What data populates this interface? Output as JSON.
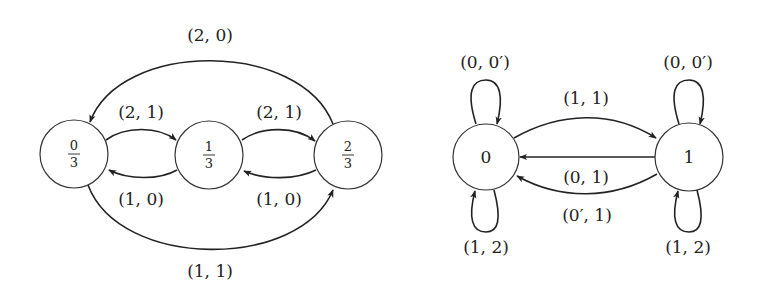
{
  "diagrams": [
    {
      "name": "left-automaton",
      "nodes": [
        {
          "id": "n0",
          "num": "0",
          "den": "3",
          "cx": 74,
          "cy": 154
        },
        {
          "id": "n1",
          "num": "1",
          "den": "3",
          "cx": 209,
          "cy": 155
        },
        {
          "id": "n2",
          "num": "2",
          "den": "3",
          "cx": 348,
          "cy": 155
        }
      ],
      "edges": [
        {
          "from": "n2",
          "to": "n0",
          "label": "(2, 0)"
        },
        {
          "from": "n0",
          "to": "n1",
          "label": "(2, 1)"
        },
        {
          "from": "n1",
          "to": "n2",
          "label": "(2, 1)"
        },
        {
          "from": "n1",
          "to": "n0",
          "label": "(1, 0)"
        },
        {
          "from": "n2",
          "to": "n1",
          "label": "(1, 0)"
        },
        {
          "from": "n0",
          "to": "n2",
          "label": "(1, 1)"
        }
      ]
    },
    {
      "name": "right-automaton",
      "nodes": [
        {
          "id": "m0",
          "label": "0",
          "cx": 486,
          "cy": 157
        },
        {
          "id": "m1",
          "label": "1",
          "cx": 688,
          "cy": 157
        }
      ],
      "edges": [
        {
          "from": "m0",
          "to": "m0",
          "label": "(0, 0′)",
          "position": "top"
        },
        {
          "from": "m0",
          "to": "m0",
          "label": "(1, 2)",
          "position": "bottom"
        },
        {
          "from": "m1",
          "to": "m1",
          "label": "(0, 0′)",
          "position": "top"
        },
        {
          "from": "m1",
          "to": "m1",
          "label": "(1, 2)",
          "position": "bottom"
        },
        {
          "from": "m0",
          "to": "m1",
          "label": "(1, 1)"
        },
        {
          "from": "m1",
          "to": "m0",
          "label": "(0, 1)"
        },
        {
          "from": "m1",
          "to": "m0",
          "label": "(0′, 1)"
        }
      ]
    }
  ],
  "labels": {
    "left": {
      "n0_num": "0",
      "n0_den": "3",
      "n1_num": "1",
      "n1_den": "3",
      "n2_num": "2",
      "n2_den": "3",
      "e_2_0_top": "(2, 0)",
      "e_0_1_upper": "(2, 1)",
      "e_1_2_upper": "(2, 1)",
      "e_1_0_lower": "(1, 0)",
      "e_2_1_lower": "(1, 0)",
      "e_0_2_bottom": "(1, 1)"
    },
    "right": {
      "m0": "0",
      "m1": "1",
      "m0_loop_top": "(0, 0′)",
      "m0_loop_bottom": "(1, 2)",
      "m1_loop_top": "(0, 0′)",
      "m1_loop_bottom": "(1, 2)",
      "e_0_1_upper": "(1, 1)",
      "e_1_0_straight": "(0, 1)",
      "e_1_0_lower": "(0′, 1)"
    }
  }
}
